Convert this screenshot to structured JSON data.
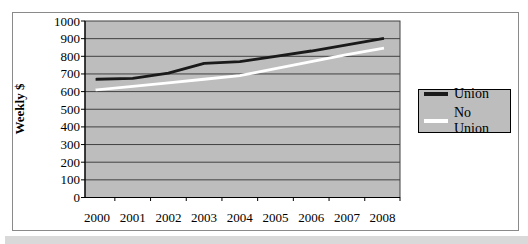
{
  "chart_data": {
    "type": "line",
    "title": "",
    "xlabel": "",
    "ylabel": "Weekly $",
    "x": [
      "2000",
      "2001",
      "2002",
      "2003",
      "2004",
      "2005",
      "2006",
      "2007",
      "2008"
    ],
    "series": [
      {
        "name": "Union",
        "color": "#1a1a1a",
        "values": [
          670,
          675,
          705,
          760,
          770,
          800,
          830,
          865,
          900
        ]
      },
      {
        "name": "No Union",
        "color": "#ffffff",
        "values": [
          610,
          630,
          650,
          670,
          690,
          730,
          770,
          810,
          845
        ]
      }
    ],
    "ylim": [
      0,
      1000
    ],
    "yticks": [
      0,
      100,
      200,
      300,
      400,
      500,
      600,
      700,
      800,
      900,
      1000
    ],
    "grid": true,
    "legend_position": "right",
    "colors": {
      "plot_bg": "#bdbdbd",
      "gridline": "#404040",
      "axis": "#000000",
      "frame_border": "#8a8a8a",
      "legend_bg": "#bdbdbd",
      "legend_border": "#000000",
      "page_band": "#d9d9d9"
    }
  }
}
